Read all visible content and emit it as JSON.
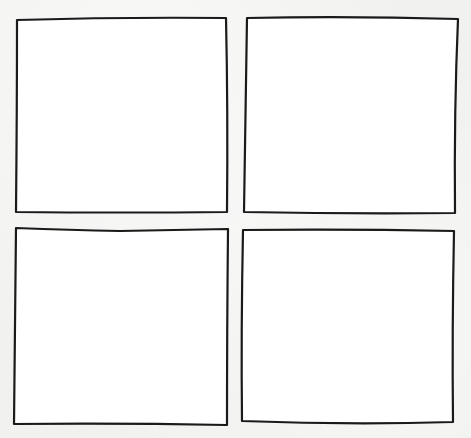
{
  "page": {
    "background_color": "#f1f1ef",
    "panel_fill": "#ffffff",
    "stroke_color": "#1a1a1a"
  },
  "panels": [
    {
      "id": "top-left",
      "x": 16,
      "y": 17,
      "w": 212,
      "h": 196,
      "content": ""
    },
    {
      "id": "top-right",
      "x": 245,
      "y": 17,
      "w": 213,
      "h": 196,
      "content": ""
    },
    {
      "id": "bottom-left",
      "x": 14,
      "y": 228,
      "w": 214,
      "h": 197,
      "content": ""
    },
    {
      "id": "bottom-right",
      "x": 241,
      "y": 229,
      "w": 214,
      "h": 195,
      "content": ""
    }
  ]
}
